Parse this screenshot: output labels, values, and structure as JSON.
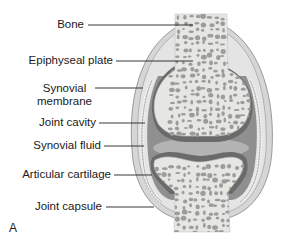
{
  "figure": {
    "panel_letter": "A",
    "labels": [
      {
        "id": "bone",
        "text": "Bone"
      },
      {
        "id": "epiphyseal-plate",
        "text": "Epiphyseal plate"
      },
      {
        "id": "synovial-membrane",
        "text": "Synovial\nmembrane",
        "line1": "Synovial",
        "line2": "membrane"
      },
      {
        "id": "joint-cavity",
        "text": "Joint cavity"
      },
      {
        "id": "synovial-fluid",
        "text": "Synovial fluid"
      },
      {
        "id": "articular-cartilage",
        "text": "Articular cartilage"
      },
      {
        "id": "joint-capsule",
        "text": "Joint capsule"
      }
    ]
  },
  "colors": {
    "bone": "#e6e6e3",
    "bone_pores": "#9a9a9a",
    "cavity": "#8f8f8f",
    "fluid": "#b0b0b0",
    "cartilage": "#6e6e6e",
    "capsule": "#d2d2d2",
    "leader_line": "#222222"
  }
}
